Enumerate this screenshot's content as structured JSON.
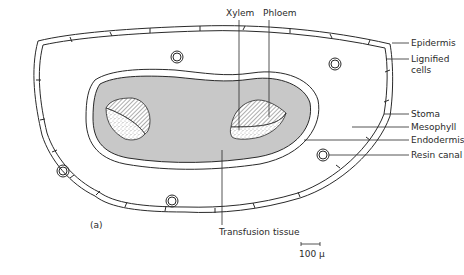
{
  "figure": {
    "panel_label": "(a)",
    "labels": {
      "xylem": "Xylem",
      "phloem": "Phloem",
      "epidermis": "Epidermis",
      "lignified_cells_line1": "Lignified",
      "lignified_cells_line2": "cells",
      "stoma": "Stoma",
      "mesophyll": "Mesophyll",
      "endodermis": "Endodermis",
      "resin_canal": "Resin canal",
      "transfusion_tissue": "Transfusion tissue"
    },
    "scale_bar": {
      "label": "100 µ"
    },
    "colors": {
      "line": "#2a2a2a",
      "stele_fill": "#c8c8c8",
      "background": "#ffffff"
    }
  }
}
